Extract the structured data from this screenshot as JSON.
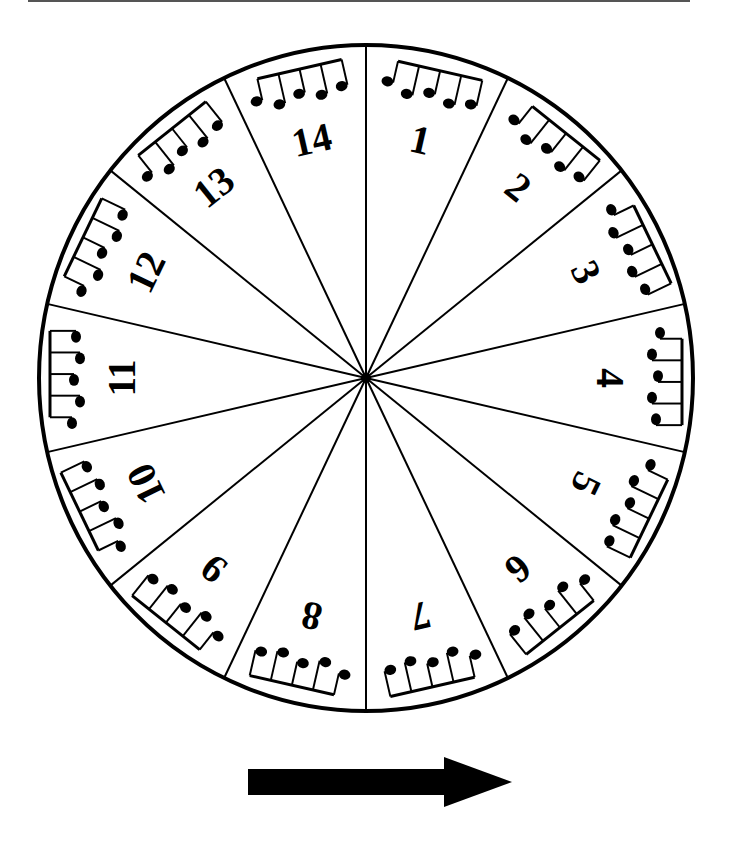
{
  "diagram": {
    "type": "rhythm-wheel",
    "segment_count": 14,
    "segments": [
      {
        "index": 0,
        "label": "1"
      },
      {
        "index": 1,
        "label": "2"
      },
      {
        "index": 2,
        "label": "3"
      },
      {
        "index": 3,
        "label": "4"
      },
      {
        "index": 4,
        "label": "5"
      },
      {
        "index": 5,
        "label": "6"
      },
      {
        "index": 6,
        "label": "7"
      },
      {
        "index": 7,
        "label": "8"
      },
      {
        "index": 8,
        "label": "9"
      },
      {
        "index": 9,
        "label": "10"
      },
      {
        "index": 10,
        "label": "11"
      },
      {
        "index": 11,
        "label": "12"
      },
      {
        "index": 12,
        "label": "13"
      },
      {
        "index": 13,
        "label": "14"
      }
    ],
    "notes_per_segment": 5,
    "direction_arrow": "right",
    "colors": {
      "ink": "#000000",
      "background": "#ffffff",
      "rule": "#555555"
    }
  }
}
